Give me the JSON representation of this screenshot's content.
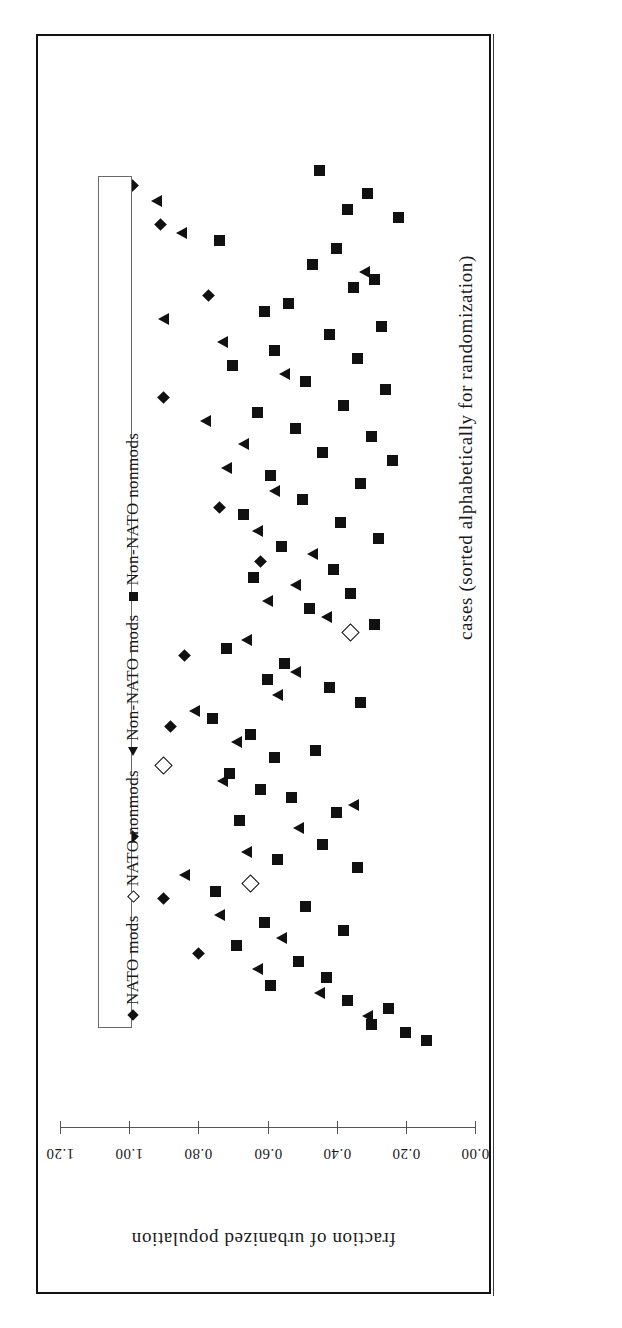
{
  "frame": {
    "present": true
  },
  "legend": {
    "entries": [
      {
        "marker": "diamond-filled",
        "label": "NATO mods"
      },
      {
        "marker": "diamond-open",
        "label": "NATO nonmods"
      },
      {
        "marker": "triangle-left",
        "label": "Non-NATO mods"
      },
      {
        "marker": "square-filled",
        "label": "Non-NATO nonmods"
      }
    ]
  },
  "axes": {
    "value_axis_title": "fraction of urbanized population",
    "value_axis_ticks": [
      "1.20",
      "1.00",
      "0.80",
      "0.60",
      "0.40",
      "0.20",
      "0.00"
    ],
    "case_axis_title": "cases (sorted alphabetically for randomization)"
  },
  "chart_data": {
    "type": "scatter",
    "title": "",
    "xlabel": "cases (sorted alphabetically for randomization)",
    "ylabel": "fraction of urbanized population",
    "orientation": "rotated-90",
    "ylim": [
      0.0,
      1.2
    ],
    "yticks": [
      1.2,
      1.0,
      0.8,
      0.6,
      0.4,
      0.2,
      0.0
    ],
    "grid": false,
    "legend_position": "inside-left-vertical",
    "note": "Each point is one country case; horizontal screen position encodes the fraction of urbanized population (axis reversed, 1.20 at left to 0.00 at right); vertical screen position encodes case index.",
    "series": [
      {
        "name": "NATO mods",
        "marker": "diamond-filled",
        "color": "#111111",
        "points": [
          {
            "case": 3,
            "value": 0.99
          },
          {
            "case": 8,
            "value": 0.91
          },
          {
            "case": 17,
            "value": 0.77
          },
          {
            "case": 30,
            "value": 0.9
          },
          {
            "case": 44,
            "value": 0.74
          },
          {
            "case": 51,
            "value": 0.62
          },
          {
            "case": 63,
            "value": 0.84
          },
          {
            "case": 72,
            "value": 0.88
          },
          {
            "case": 86,
            "value": 0.99
          },
          {
            "case": 94,
            "value": 0.9
          },
          {
            "case": 101,
            "value": 0.8
          }
        ]
      },
      {
        "name": "NATO nonmods",
        "marker": "diamond-open",
        "color": "#111111",
        "points": [
          {
            "case": 77,
            "value": 0.9
          },
          {
            "case": 92,
            "value": 0.65
          },
          {
            "case": 60,
            "value": 0.36
          }
        ]
      },
      {
        "name": "Non-NATO mods",
        "marker": "triangle-left",
        "color": "#111111",
        "points": [
          {
            "case": 5,
            "value": 0.92
          },
          {
            "case": 9,
            "value": 0.85
          },
          {
            "case": 14,
            "value": 0.32
          },
          {
            "case": 20,
            "value": 0.9
          },
          {
            "case": 23,
            "value": 0.73
          },
          {
            "case": 27,
            "value": 0.55
          },
          {
            "case": 33,
            "value": 0.78
          },
          {
            "case": 36,
            "value": 0.67
          },
          {
            "case": 39,
            "value": 0.72
          },
          {
            "case": 42,
            "value": 0.58
          },
          {
            "case": 47,
            "value": 0.63
          },
          {
            "case": 50,
            "value": 0.47
          },
          {
            "case": 54,
            "value": 0.52
          },
          {
            "case": 56,
            "value": 0.6
          },
          {
            "case": 58,
            "value": 0.43
          },
          {
            "case": 61,
            "value": 0.66
          },
          {
            "case": 65,
            "value": 0.52
          },
          {
            "case": 68,
            "value": 0.57
          },
          {
            "case": 70,
            "value": 0.81
          },
          {
            "case": 74,
            "value": 0.69
          },
          {
            "case": 79,
            "value": 0.73
          },
          {
            "case": 82,
            "value": 0.35
          },
          {
            "case": 85,
            "value": 0.51
          },
          {
            "case": 88,
            "value": 0.66
          },
          {
            "case": 91,
            "value": 0.84
          },
          {
            "case": 96,
            "value": 0.74
          },
          {
            "case": 99,
            "value": 0.56
          },
          {
            "case": 103,
            "value": 0.63
          },
          {
            "case": 106,
            "value": 0.45
          },
          {
            "case": 109,
            "value": 0.31
          }
        ]
      },
      {
        "name": "Non-NATO nonmods",
        "marker": "square-filled",
        "color": "#111111",
        "points": [
          {
            "case": 1,
            "value": 0.45
          },
          {
            "case": 4,
            "value": 0.31
          },
          {
            "case": 6,
            "value": 0.37
          },
          {
            "case": 7,
            "value": 0.22
          },
          {
            "case": 10,
            "value": 0.74
          },
          {
            "case": 11,
            "value": 0.4
          },
          {
            "case": 13,
            "value": 0.47
          },
          {
            "case": 15,
            "value": 0.29
          },
          {
            "case": 16,
            "value": 0.35
          },
          {
            "case": 18,
            "value": 0.54
          },
          {
            "case": 19,
            "value": 0.61
          },
          {
            "case": 21,
            "value": 0.27
          },
          {
            "case": 22,
            "value": 0.42
          },
          {
            "case": 24,
            "value": 0.58
          },
          {
            "case": 25,
            "value": 0.34
          },
          {
            "case": 26,
            "value": 0.7
          },
          {
            "case": 28,
            "value": 0.49
          },
          {
            "case": 29,
            "value": 0.26
          },
          {
            "case": 31,
            "value": 0.38
          },
          {
            "case": 32,
            "value": 0.63
          },
          {
            "case": 34,
            "value": 0.52
          },
          {
            "case": 35,
            "value": 0.3
          },
          {
            "case": 37,
            "value": 0.44
          },
          {
            "case": 38,
            "value": 0.24
          },
          {
            "case": 40,
            "value": 0.59
          },
          {
            "case": 41,
            "value": 0.33
          },
          {
            "case": 43,
            "value": 0.5
          },
          {
            "case": 45,
            "value": 0.67
          },
          {
            "case": 46,
            "value": 0.39
          },
          {
            "case": 48,
            "value": 0.28
          },
          {
            "case": 49,
            "value": 0.56
          },
          {
            "case": 52,
            "value": 0.41
          },
          {
            "case": 53,
            "value": 0.64
          },
          {
            "case": 55,
            "value": 0.36
          },
          {
            "case": 57,
            "value": 0.48
          },
          {
            "case": 59,
            "value": 0.29
          },
          {
            "case": 62,
            "value": 0.72
          },
          {
            "case": 64,
            "value": 0.55
          },
          {
            "case": 66,
            "value": 0.6
          },
          {
            "case": 67,
            "value": 0.42
          },
          {
            "case": 69,
            "value": 0.33
          },
          {
            "case": 71,
            "value": 0.76
          },
          {
            "case": 73,
            "value": 0.65
          },
          {
            "case": 75,
            "value": 0.46
          },
          {
            "case": 76,
            "value": 0.58
          },
          {
            "case": 78,
            "value": 0.71
          },
          {
            "case": 80,
            "value": 0.62
          },
          {
            "case": 81,
            "value": 0.53
          },
          {
            "case": 83,
            "value": 0.4
          },
          {
            "case": 84,
            "value": 0.68
          },
          {
            "case": 87,
            "value": 0.44
          },
          {
            "case": 89,
            "value": 0.57
          },
          {
            "case": 90,
            "value": 0.34
          },
          {
            "case": 93,
            "value": 0.75
          },
          {
            "case": 95,
            "value": 0.49
          },
          {
            "case": 97,
            "value": 0.61
          },
          {
            "case": 98,
            "value": 0.38
          },
          {
            "case": 100,
            "value": 0.69
          },
          {
            "case": 102,
            "value": 0.51
          },
          {
            "case": 104,
            "value": 0.43
          },
          {
            "case": 105,
            "value": 0.59
          },
          {
            "case": 107,
            "value": 0.37
          },
          {
            "case": 108,
            "value": 0.25
          },
          {
            "case": 110,
            "value": 0.3
          },
          {
            "case": 111,
            "value": 0.2
          },
          {
            "case": 112,
            "value": 0.14
          }
        ]
      }
    ]
  }
}
